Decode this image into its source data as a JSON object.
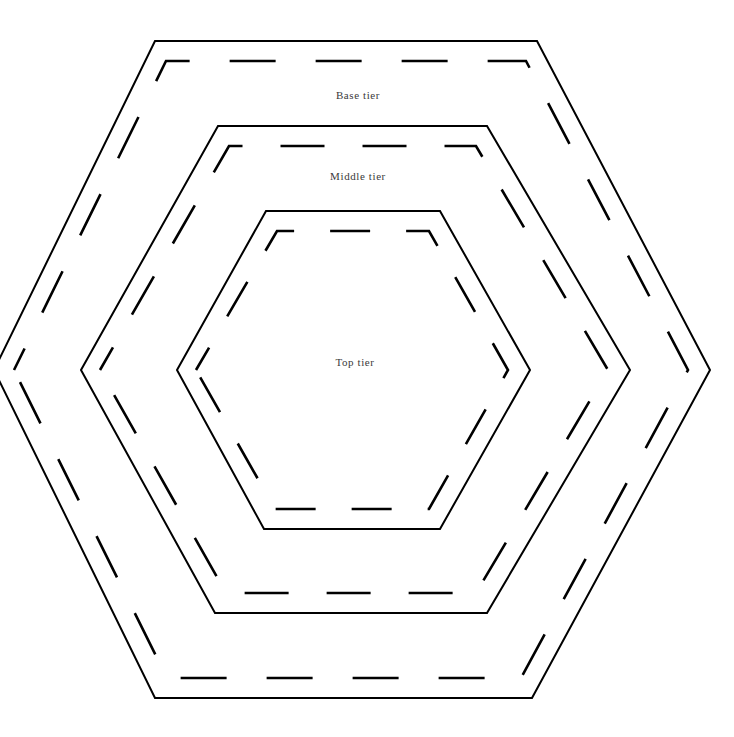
{
  "document": {
    "title": "Nested hexagon tier templates",
    "background_color": "#ffffff",
    "line_color": "#000000",
    "label_color": "#3a3a3a",
    "width": 734,
    "height": 737
  },
  "tiers": [
    {
      "id": "base",
      "label": "Base tier",
      "label_x": 358,
      "label_y": 99,
      "cut_points": "-6,370 155,41 537,41 710,370 532,698 155,698",
      "seam_points": "14,370 166,61 526,61 688,370 521,678 167,678",
      "seam_dash": "46 40",
      "seam_dash_offset": 22
    },
    {
      "id": "middle",
      "label": "Middle tier",
      "label_x": 358,
      "label_y": 180,
      "cut_points": "81,370 218,126 487,126 630,370 487,613 215,613",
      "seam_points": "100,370 229,146 476,146 608,370 476,593 226,593",
      "seam_dash": "44 38",
      "seam_dash_offset": 18
    },
    {
      "id": "top",
      "label": "Top tier",
      "label_x": 355,
      "label_y": 366,
      "cut_points": "177,370 266,211 440,211 530,370 440,529 264,529",
      "seam_points": "196,370 277,231 429,231 508,370 429,509 275,509",
      "seam_dash": "40 36",
      "seam_dash_offset": 14
    }
  ]
}
